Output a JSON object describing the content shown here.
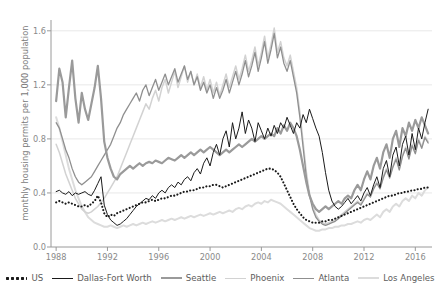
{
  "chart_data": {
    "type": "line",
    "title": "",
    "xlabel": "",
    "ylabel": "monthly housing permits per 1,000 population",
    "xlim": [
      1987.6,
      2017.3
    ],
    "ylim": [
      0.0,
      1.68
    ],
    "xticks": [
      "1988",
      "1992",
      "1996",
      "2000",
      "2004",
      "2008",
      "2012",
      "2016"
    ],
    "xtick_values": [
      1988,
      1992,
      1996,
      2000,
      2004,
      2008,
      2012,
      2016
    ],
    "yticks": [
      "0.0",
      "0.4",
      "0.8",
      "1.2",
      "1.6"
    ],
    "ytick_values": [
      0.0,
      0.4,
      0.8,
      1.2,
      1.6
    ],
    "grid": "horizontal",
    "legend_position": "bottom",
    "x_start": 1988.0,
    "x_step": 0.25,
    "series": [
      {
        "name": "US",
        "color": "#1a1a1a",
        "width": 2.1,
        "style": "dotted",
        "values": [
          0.33,
          0.34,
          0.33,
          0.32,
          0.33,
          0.32,
          0.31,
          0.3,
          0.3,
          0.31,
          0.3,
          0.32,
          0.34,
          0.38,
          0.33,
          0.25,
          0.22,
          0.24,
          0.23,
          0.25,
          0.26,
          0.27,
          0.28,
          0.29,
          0.3,
          0.31,
          0.32,
          0.33,
          0.33,
          0.34,
          0.35,
          0.34,
          0.35,
          0.36,
          0.36,
          0.37,
          0.38,
          0.38,
          0.39,
          0.4,
          0.41,
          0.41,
          0.42,
          0.42,
          0.43,
          0.44,
          0.44,
          0.45,
          0.45,
          0.46,
          0.46,
          0.45,
          0.44,
          0.45,
          0.46,
          0.47,
          0.48,
          0.49,
          0.5,
          0.51,
          0.52,
          0.53,
          0.54,
          0.55,
          0.56,
          0.57,
          0.58,
          0.58,
          0.57,
          0.55,
          0.52,
          0.47,
          0.42,
          0.37,
          0.32,
          0.28,
          0.25,
          0.22,
          0.2,
          0.19,
          0.18,
          0.18,
          0.18,
          0.19,
          0.19,
          0.2,
          0.2,
          0.21,
          0.22,
          0.23,
          0.24,
          0.25,
          0.26,
          0.27,
          0.28,
          0.29,
          0.3,
          0.31,
          0.32,
          0.33,
          0.34,
          0.35,
          0.36,
          0.37,
          0.38,
          0.38,
          0.39,
          0.4,
          0.4,
          0.41,
          0.41,
          0.42,
          0.42,
          0.43,
          0.43,
          0.44,
          0.44
        ]
      },
      {
        "name": "Dallas-Fort Worth",
        "color": "#1a1a1a",
        "width": 1.0,
        "style": "solid",
        "values": [
          0.41,
          0.42,
          0.4,
          0.39,
          0.41,
          0.38,
          0.4,
          0.39,
          0.4,
          0.41,
          0.39,
          0.38,
          0.42,
          0.47,
          0.52,
          0.31,
          0.24,
          0.2,
          0.18,
          0.16,
          0.17,
          0.19,
          0.21,
          0.24,
          0.27,
          0.3,
          0.32,
          0.34,
          0.36,
          0.35,
          0.38,
          0.36,
          0.4,
          0.42,
          0.4,
          0.44,
          0.46,
          0.44,
          0.48,
          0.46,
          0.5,
          0.52,
          0.49,
          0.55,
          0.58,
          0.54,
          0.62,
          0.66,
          0.6,
          0.7,
          0.76,
          0.68,
          0.8,
          0.86,
          0.74,
          0.92,
          0.8,
          0.88,
          1.0,
          0.84,
          0.94,
          0.88,
          0.78,
          0.92,
          0.86,
          0.8,
          0.88,
          0.82,
          0.9,
          0.84,
          0.92,
          0.88,
          0.96,
          0.9,
          0.84,
          0.92,
          0.88,
          0.98,
          0.92,
          1.02,
          0.95,
          0.88,
          0.82,
          0.7,
          0.55,
          0.42,
          0.34,
          0.3,
          0.28,
          0.3,
          0.33,
          0.36,
          0.32,
          0.35,
          0.38,
          0.34,
          0.4,
          0.44,
          0.38,
          0.46,
          0.52,
          0.44,
          0.58,
          0.64,
          0.52,
          0.68,
          0.74,
          0.6,
          0.76,
          0.82,
          0.68,
          0.84,
          0.72,
          0.88,
          0.8,
          0.92,
          1.02
        ]
      },
      {
        "name": "Seattle",
        "color": "#9a9a9a",
        "width": 2.2,
        "style": "solid",
        "values": [
          1.08,
          1.32,
          1.22,
          0.96,
          1.18,
          1.38,
          1.1,
          0.92,
          1.14,
          1.02,
          0.94,
          1.06,
          1.18,
          1.34,
          1.1,
          0.78,
          0.66,
          0.58,
          0.52,
          0.5,
          0.54,
          0.56,
          0.58,
          0.6,
          0.58,
          0.6,
          0.62,
          0.6,
          0.62,
          0.63,
          0.62,
          0.64,
          0.63,
          0.62,
          0.64,
          0.66,
          0.65,
          0.64,
          0.66,
          0.68,
          0.66,
          0.68,
          0.7,
          0.68,
          0.7,
          0.72,
          0.7,
          0.72,
          0.74,
          0.72,
          0.7,
          0.68,
          0.7,
          0.72,
          0.7,
          0.72,
          0.74,
          0.76,
          0.74,
          0.76,
          0.78,
          0.8,
          0.78,
          0.8,
          0.82,
          0.8,
          0.82,
          0.84,
          0.82,
          0.88,
          0.84,
          0.9,
          0.86,
          0.92,
          0.88,
          0.82,
          0.72,
          0.6,
          0.48,
          0.38,
          0.32,
          0.28,
          0.26,
          0.28,
          0.3,
          0.28,
          0.3,
          0.32,
          0.34,
          0.32,
          0.36,
          0.38,
          0.36,
          0.42,
          0.46,
          0.42,
          0.5,
          0.56,
          0.5,
          0.6,
          0.66,
          0.58,
          0.7,
          0.76,
          0.66,
          0.8,
          0.86,
          0.74,
          0.88,
          0.82,
          0.92,
          0.86,
          0.94,
          0.88,
          0.96,
          0.9,
          0.84
        ]
      },
      {
        "name": "Phoenix",
        "color": "#d2d2d2",
        "width": 1.5,
        "style": "solid",
        "values": [
          0.76,
          0.7,
          0.62,
          0.54,
          0.48,
          0.42,
          0.36,
          0.32,
          0.28,
          0.26,
          0.25,
          0.26,
          0.28,
          0.3,
          0.33,
          0.36,
          0.4,
          0.44,
          0.48,
          0.52,
          0.58,
          0.64,
          0.7,
          0.76,
          0.82,
          0.88,
          0.94,
          1.0,
          1.06,
          1.02,
          1.1,
          1.16,
          1.08,
          1.18,
          1.24,
          1.14,
          1.22,
          1.3,
          1.18,
          1.26,
          1.34,
          1.22,
          1.3,
          1.2,
          1.28,
          1.18,
          1.26,
          1.16,
          1.24,
          1.14,
          1.22,
          1.12,
          1.2,
          1.28,
          1.18,
          1.26,
          1.34,
          1.24,
          1.32,
          1.42,
          1.3,
          1.38,
          1.48,
          1.34,
          1.44,
          1.56,
          1.4,
          1.5,
          1.62,
          1.44,
          1.52,
          1.4,
          1.34,
          1.42,
          1.3,
          1.18,
          1.0,
          0.78,
          0.56,
          0.4,
          0.3,
          0.24,
          0.2,
          0.18,
          0.17,
          0.18,
          0.19,
          0.2,
          0.22,
          0.24,
          0.26,
          0.28,
          0.3,
          0.32,
          0.34,
          0.32,
          0.36,
          0.4,
          0.38,
          0.44,
          0.48,
          0.44,
          0.52,
          0.58,
          0.52,
          0.6,
          0.66,
          0.58,
          0.68,
          0.74,
          0.66,
          0.76,
          0.7,
          0.8,
          0.74,
          0.82,
          0.78
        ]
      },
      {
        "name": "Atlanta",
        "color": "#8f8f8f",
        "width": 1.3,
        "style": "solid",
        "values": [
          0.92,
          0.88,
          0.8,
          0.72,
          0.66,
          0.58,
          0.52,
          0.48,
          0.46,
          0.48,
          0.5,
          0.52,
          0.56,
          0.6,
          0.64,
          0.68,
          0.72,
          0.76,
          0.82,
          0.88,
          0.92,
          0.98,
          1.02,
          1.06,
          1.1,
          1.14,
          1.08,
          1.16,
          1.2,
          1.12,
          1.18,
          1.24,
          1.16,
          1.22,
          1.28,
          1.2,
          1.26,
          1.32,
          1.22,
          1.28,
          1.34,
          1.24,
          1.3,
          1.2,
          1.26,
          1.16,
          1.22,
          1.14,
          1.2,
          1.1,
          1.18,
          1.1,
          1.16,
          1.24,
          1.14,
          1.22,
          1.3,
          1.2,
          1.28,
          1.38,
          1.26,
          1.34,
          1.44,
          1.3,
          1.4,
          1.52,
          1.36,
          1.46,
          1.58,
          1.4,
          1.48,
          1.36,
          1.3,
          1.38,
          1.26,
          1.14,
          0.96,
          0.74,
          0.52,
          0.38,
          0.28,
          0.22,
          0.19,
          0.17,
          0.16,
          0.17,
          0.18,
          0.19,
          0.21,
          0.23,
          0.25,
          0.27,
          0.29,
          0.31,
          0.33,
          0.31,
          0.35,
          0.39,
          0.37,
          0.43,
          0.47,
          0.43,
          0.51,
          0.57,
          0.51,
          0.59,
          0.65,
          0.57,
          0.67,
          0.73,
          0.65,
          0.75,
          0.69,
          0.79,
          0.73,
          0.81,
          0.77
        ]
      },
      {
        "name": "Los Angeles",
        "color": "#dcdcdc",
        "width": 2.0,
        "style": "solid",
        "values": [
          0.96,
          0.88,
          0.78,
          0.68,
          0.58,
          0.5,
          0.42,
          0.36,
          0.3,
          0.26,
          0.22,
          0.2,
          0.18,
          0.17,
          0.16,
          0.15,
          0.15,
          0.16,
          0.15,
          0.14,
          0.15,
          0.16,
          0.15,
          0.16,
          0.17,
          0.16,
          0.17,
          0.18,
          0.17,
          0.18,
          0.19,
          0.18,
          0.19,
          0.2,
          0.19,
          0.2,
          0.21,
          0.2,
          0.21,
          0.22,
          0.21,
          0.22,
          0.23,
          0.22,
          0.23,
          0.24,
          0.23,
          0.24,
          0.25,
          0.24,
          0.25,
          0.26,
          0.25,
          0.26,
          0.27,
          0.26,
          0.28,
          0.29,
          0.28,
          0.3,
          0.31,
          0.3,
          0.32,
          0.33,
          0.32,
          0.34,
          0.33,
          0.35,
          0.34,
          0.33,
          0.32,
          0.3,
          0.28,
          0.26,
          0.24,
          0.22,
          0.2,
          0.18,
          0.16,
          0.14,
          0.13,
          0.12,
          0.12,
          0.13,
          0.13,
          0.14,
          0.14,
          0.15,
          0.15,
          0.16,
          0.16,
          0.17,
          0.17,
          0.18,
          0.19,
          0.18,
          0.2,
          0.21,
          0.2,
          0.22,
          0.24,
          0.22,
          0.26,
          0.28,
          0.26,
          0.3,
          0.32,
          0.3,
          0.34,
          0.36,
          0.34,
          0.38,
          0.36,
          0.4,
          0.38,
          0.42,
          0.44
        ]
      }
    ]
  },
  "legend": {
    "items": [
      {
        "label": "US"
      },
      {
        "label": "Dallas-Fort Worth"
      },
      {
        "label": "Seattle"
      },
      {
        "label": "Phoenix"
      },
      {
        "label": "Atlanta"
      },
      {
        "label": "Los Angeles"
      }
    ]
  }
}
